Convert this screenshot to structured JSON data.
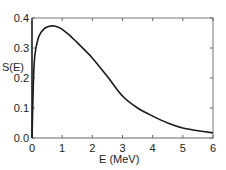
{
  "chart_data": {
    "type": "line",
    "title": "",
    "xlabel": "E (MeV)",
    "ylabel": "S(E)",
    "xlim": [
      0,
      6
    ],
    "ylim": [
      0.0,
      0.4
    ],
    "grid": false,
    "legend": null,
    "x_ticks": [
      "0",
      "1",
      "2",
      "3",
      "4",
      "5",
      "6"
    ],
    "y_ticks": [
      "0.0",
      "0.1",
      "0.2",
      "0.3",
      "0.4"
    ],
    "series": [
      {
        "name": "S(E)",
        "x": [
          0,
          0.05,
          0.1,
          0.2,
          0.3,
          0.4,
          0.5,
          0.6,
          0.7,
          0.8,
          0.9,
          1.0,
          1.25,
          1.5,
          1.75,
          2.0,
          2.5,
          3.0,
          3.5,
          4.0,
          4.5,
          5.0,
          5.5,
          6.0
        ],
        "y": [
          0.0,
          0.2,
          0.28,
          0.33,
          0.352,
          0.364,
          0.37,
          0.373,
          0.374,
          0.372,
          0.368,
          0.362,
          0.342,
          0.318,
          0.293,
          0.267,
          0.205,
          0.14,
          0.1,
          0.073,
          0.05,
          0.033,
          0.024,
          0.017
        ]
      }
    ]
  }
}
